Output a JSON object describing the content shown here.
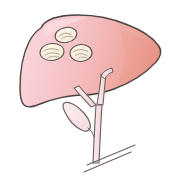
{
  "figure": {
    "background_color": "#FFFFFF",
    "canvas": {
      "width": 179,
      "height": 185
    }
  },
  "colors": {
    "liver_light_pink": "#F7CBD1",
    "liver_mid_pink": "#F4B6B6",
    "liver_salmon": "#EFA69B",
    "liver_deep_salmon": "#E99287",
    "outline_dark": "#4A4442",
    "outline_duct": "#6B6360",
    "lesion_fill": "#FBF3E4",
    "lesion_outline": "#5A5450",
    "lesion_detail": "#8A8378",
    "gallbladder_fill": "#FBE4E6",
    "duct_fill": "#F9E3E6"
  },
  "organs": {
    "liver": {
      "label": "liver",
      "fill_gradient_from": "#F8D2D6",
      "fill_gradient_to": "#E99287",
      "stroke": "#4A4442",
      "stroke_width": 1.4
    },
    "gallbladder": {
      "label": "gallbladder",
      "fill": "#FBE4E6",
      "stroke": "#6B6360",
      "stroke_width": 1.2
    },
    "biliary_tree": {
      "label": "biliary-duct-tree",
      "fill": "#F9E3E6",
      "stroke": "#6B6360",
      "stroke_width": 1.2,
      "branches": 3
    },
    "duodenum_line": {
      "label": "duodenum-reference-line",
      "stroke": "#6B6360",
      "stroke_width": 1.1
    }
  },
  "lesions": {
    "count": 3,
    "label": "nodular-lesions",
    "items": [
      {
        "id": "lesion-top",
        "cx": 66,
        "cy": 35,
        "rx": 11,
        "ry": 7.5,
        "rotation": -12
      },
      {
        "id": "lesion-left",
        "cx": 52,
        "cy": 52,
        "rx": 12,
        "ry": 8.5,
        "rotation": -6
      },
      {
        "id": "lesion-right",
        "cx": 81,
        "cy": 53,
        "rx": 11,
        "ry": 8.5,
        "rotation": -4
      }
    ]
  }
}
